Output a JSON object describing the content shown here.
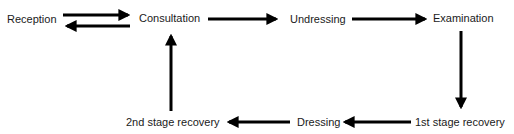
{
  "diagram": {
    "type": "flow",
    "colors": {
      "text": "#1a1a1a",
      "arrow": "#000000",
      "background": "#ffffff"
    },
    "nodes": [
      {
        "id": "reception",
        "label": "Reception"
      },
      {
        "id": "consultation",
        "label": "Consultation"
      },
      {
        "id": "undressing",
        "label": "Undressing"
      },
      {
        "id": "examination",
        "label": "Examination"
      },
      {
        "id": "stage1",
        "label": "1st stage recovery"
      },
      {
        "id": "dressing",
        "label": "Dressing"
      },
      {
        "id": "stage2",
        "label": "2nd stage recovery"
      }
    ],
    "edges": [
      {
        "from": "reception",
        "to": "consultation"
      },
      {
        "from": "consultation",
        "to": "reception"
      },
      {
        "from": "consultation",
        "to": "undressing"
      },
      {
        "from": "undressing",
        "to": "examination"
      },
      {
        "from": "examination",
        "to": "stage1"
      },
      {
        "from": "stage1",
        "to": "dressing"
      },
      {
        "from": "dressing",
        "to": "stage2"
      },
      {
        "from": "stage2",
        "to": "consultation"
      }
    ]
  }
}
